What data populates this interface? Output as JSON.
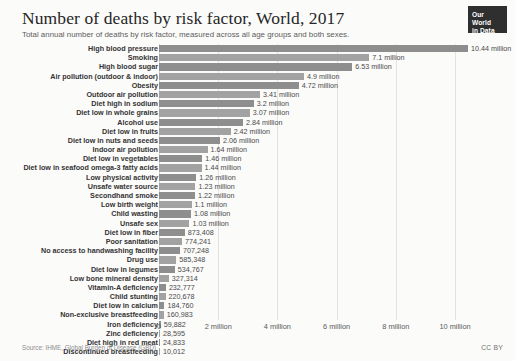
{
  "header": {
    "title": "Number of deaths by risk factor, World, 2017",
    "subtitle": "Total annual number of deaths by risk factor, measured across all age groups and both sexes."
  },
  "logo": {
    "line1": "Our World",
    "line2": "in Data"
  },
  "footer": {
    "source": "Source: IHME, Global Burden of Disease (GBD)",
    "license": "CC BY"
  },
  "colors": {
    "bar": "#8e8e8e",
    "bar_alt": "#a2a2a2",
    "gridline": "#e2e2e0",
    "text": "#333333",
    "logo_background": "#2f2f2f"
  },
  "chart_data": {
    "type": "bar",
    "orientation": "horizontal",
    "title": "Number of deaths by risk factor, World, 2017",
    "subtitle": "Total annual number of deaths by risk factor, measured across all age groups and both sexes.",
    "xlabel": "",
    "ylabel": "",
    "xlim": [
      0,
      11200000
    ],
    "grid": true,
    "legend": "none",
    "xticks": [
      {
        "value": 0,
        "label": "0"
      },
      {
        "value": 2000000,
        "label": "2 million"
      },
      {
        "value": 4000000,
        "label": "4 million"
      },
      {
        "value": 6000000,
        "label": "6 million"
      },
      {
        "value": 8000000,
        "label": "8 million"
      },
      {
        "value": 10000000,
        "label": "10 million"
      }
    ],
    "categories": [
      "High blood pressure",
      "Smoking",
      "High blood sugar",
      "Air pollution (outdoor & indoor)",
      "Obesity",
      "Outdoor air pollution",
      "Diet high in sodium",
      "Diet low in whole grains",
      "Alcohol use",
      "Diet low in fruits",
      "Diet low in nuts and seeds",
      "Indoor air pollution",
      "Diet low in vegetables",
      "Diet low in seafood omega-3 fatty acids",
      "Low physical activity",
      "Unsafe water source",
      "Secondhand smoke",
      "Low birth weight",
      "Child wasting",
      "Unsafe sex",
      "Diet low in fiber",
      "Poor sanitation",
      "No access to handwashing facility",
      "Drug use",
      "Diet low in legumes",
      "Low bone mineral density",
      "Vitamin-A deficiency",
      "Child stunting",
      "Diet low in calcium",
      "Non-exclusive breastfeeding",
      "Iron deficiency",
      "Zinc deficiency",
      "Diet high in red meat",
      "Discontinued breastfeeding"
    ],
    "values": [
      10440000,
      7100000,
      6530000,
      4900000,
      4720000,
      3410000,
      3200000,
      3070000,
      2840000,
      2420000,
      2060000,
      1640000,
      1460000,
      1440000,
      1260000,
      1230000,
      1220000,
      1100000,
      1080000,
      1030000,
      873408,
      774241,
      707248,
      585348,
      534767,
      327314,
      232777,
      220678,
      184760,
      160983,
      59882,
      28595,
      24833,
      10012
    ],
    "value_labels": [
      "10.44 million",
      "7.1 million",
      "6.53 million",
      "4.9 million",
      "4.72 million",
      "3.41 million",
      "3.2 million",
      "3.07 million",
      "2.84 million",
      "2.42 million",
      "2.06 million",
      "1.64 million",
      "1.46 million",
      "1.44 million",
      "1.26 million",
      "1.23 million",
      "1.22 million",
      "1.1 million",
      "1.08 million",
      "1.03 million",
      "873,408",
      "774,241",
      "707,248",
      "585,348",
      "534,767",
      "327,314",
      "232,777",
      "220,678",
      "184,760",
      "160,983",
      "59,882",
      "28,595",
      "24,833",
      "10,012"
    ]
  }
}
